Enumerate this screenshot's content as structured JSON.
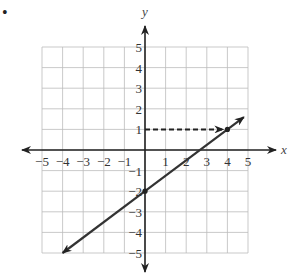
{
  "bullet": "•",
  "chart_data": {
    "type": "line",
    "title": "",
    "xlabel": "x",
    "ylabel": "y",
    "xlim": [
      -5,
      5
    ],
    "ylim": [
      -5,
      5
    ],
    "grid": true,
    "x_ticks": [
      "−5",
      "−4",
      "−3",
      "−2",
      "−1",
      "1",
      "2",
      "3",
      "4",
      "5"
    ],
    "y_ticks": [
      "5",
      "4",
      "3",
      "2",
      "1",
      "−1",
      "−2",
      "−3",
      "−4",
      "−5"
    ],
    "series": [
      {
        "name": "line",
        "style": "solid, arrows both ends",
        "equation": "y = (3/4)x - 2",
        "points": [
          [
            -4,
            -5
          ],
          [
            0,
            -2
          ],
          [
            4,
            1
          ],
          [
            4.8,
            1.6
          ]
        ]
      },
      {
        "name": "guide",
        "style": "dashed, arrow toward point",
        "points": [
          [
            0,
            1
          ],
          [
            4,
            1
          ]
        ]
      }
    ],
    "marked_points": [
      [
        4,
        1
      ],
      [
        0,
        -2
      ]
    ]
  }
}
